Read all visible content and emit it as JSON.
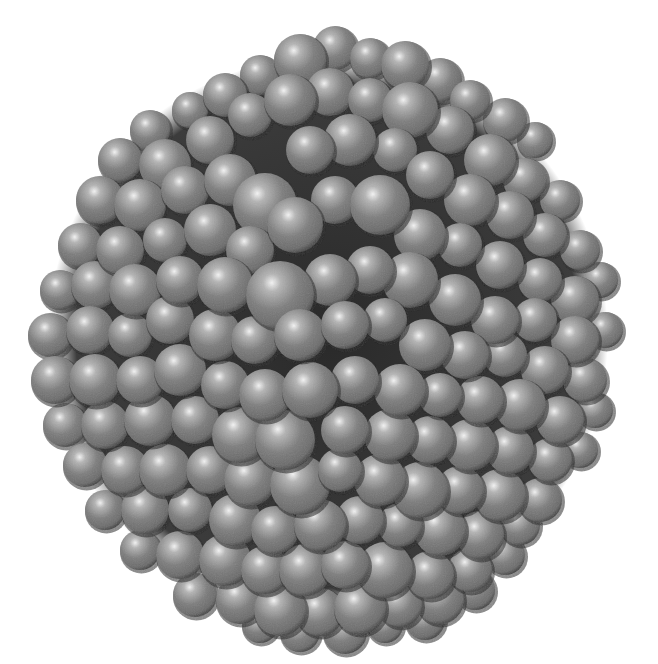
{
  "image": {
    "subject": "spherical cluster of gray spheres (space-filling molecular model)",
    "background": "#ffffff",
    "width": 658,
    "height": 664
  },
  "cluster": {
    "center": [
      328,
      336
    ],
    "radius": 298,
    "colors": {
      "highlight": "#f4f4f4",
      "mid": "#9a9a9a",
      "base": "#7c7c7c",
      "shadow": "#3a3a3a",
      "crevice": "#1e1e1e"
    },
    "spheres": [
      [
        300,
        60,
        26
      ],
      [
        335,
        48,
        22
      ],
      [
        370,
        58,
        20
      ],
      [
        405,
        65,
        24
      ],
      [
        440,
        80,
        22
      ],
      [
        260,
        75,
        20
      ],
      [
        225,
        95,
        22
      ],
      [
        190,
        110,
        18
      ],
      [
        470,
        100,
        20
      ],
      [
        505,
        120,
        22
      ],
      [
        535,
        140,
        18
      ],
      [
        150,
        130,
        20
      ],
      [
        120,
        160,
        22
      ],
      [
        165,
        165,
        26
      ],
      [
        210,
        140,
        24
      ],
      [
        250,
        115,
        22
      ],
      [
        290,
        100,
        26
      ],
      [
        330,
        92,
        24
      ],
      [
        370,
        100,
        22
      ],
      [
        410,
        110,
        28
      ],
      [
        450,
        130,
        24
      ],
      [
        490,
        160,
        26
      ],
      [
        525,
        180,
        22
      ],
      [
        560,
        200,
        20
      ],
      [
        100,
        200,
        24
      ],
      [
        140,
        205,
        26
      ],
      [
        185,
        190,
        24
      ],
      [
        230,
        180,
        26
      ],
      [
        265,
        205,
        32
      ],
      [
        310,
        150,
        24
      ],
      [
        350,
        140,
        26
      ],
      [
        395,
        150,
        22
      ],
      [
        430,
        175,
        24
      ],
      [
        470,
        200,
        26
      ],
      [
        510,
        215,
        24
      ],
      [
        545,
        235,
        22
      ],
      [
        580,
        250,
        20
      ],
      [
        80,
        245,
        22
      ],
      [
        120,
        250,
        24
      ],
      [
        165,
        240,
        22
      ],
      [
        210,
        230,
        26
      ],
      [
        250,
        250,
        24
      ],
      [
        295,
        225,
        28
      ],
      [
        335,
        200,
        24
      ],
      [
        380,
        205,
        30
      ],
      [
        420,
        235,
        26
      ],
      [
        460,
        245,
        22
      ],
      [
        500,
        265,
        24
      ],
      [
        540,
        280,
        22
      ],
      [
        575,
        300,
        24
      ],
      [
        600,
        280,
        18
      ],
      [
        60,
        290,
        20
      ],
      [
        95,
        285,
        24
      ],
      [
        135,
        290,
        26
      ],
      [
        180,
        280,
        24
      ],
      [
        225,
        285,
        28
      ],
      [
        280,
        295,
        34
      ],
      [
        330,
        280,
        26
      ],
      [
        370,
        270,
        24
      ],
      [
        410,
        280,
        28
      ],
      [
        455,
        300,
        26
      ],
      [
        495,
        320,
        24
      ],
      [
        535,
        320,
        22
      ],
      [
        575,
        340,
        24
      ],
      [
        605,
        330,
        18
      ],
      [
        50,
        335,
        22
      ],
      [
        90,
        330,
        24
      ],
      [
        130,
        335,
        22
      ],
      [
        170,
        320,
        24
      ],
      [
        215,
        335,
        26
      ],
      [
        255,
        340,
        24
      ],
      [
        300,
        335,
        26
      ],
      [
        345,
        325,
        24
      ],
      [
        385,
        320,
        22
      ],
      [
        425,
        345,
        26
      ],
      [
        465,
        355,
        24
      ],
      [
        505,
        355,
        22
      ],
      [
        545,
        370,
        24
      ],
      [
        585,
        380,
        22
      ],
      [
        55,
        380,
        24
      ],
      [
        95,
        380,
        26
      ],
      [
        140,
        380,
        24
      ],
      [
        180,
        370,
        26
      ],
      [
        225,
        385,
        24
      ],
      [
        265,
        395,
        26
      ],
      [
        310,
        390,
        28
      ],
      [
        355,
        380,
        24
      ],
      [
        400,
        390,
        26
      ],
      [
        440,
        395,
        22
      ],
      [
        480,
        400,
        24
      ],
      [
        520,
        405,
        26
      ],
      [
        560,
        420,
        24
      ],
      [
        595,
        410,
        18
      ],
      [
        65,
        425,
        22
      ],
      [
        105,
        425,
        24
      ],
      [
        150,
        420,
        26
      ],
      [
        195,
        420,
        24
      ],
      [
        240,
        435,
        28
      ],
      [
        285,
        440,
        30
      ],
      [
        345,
        430,
        24
      ],
      [
        390,
        435,
        26
      ],
      [
        430,
        440,
        24
      ],
      [
        470,
        445,
        26
      ],
      [
        510,
        450,
        24
      ],
      [
        550,
        460,
        22
      ],
      [
        580,
        450,
        18
      ],
      [
        85,
        465,
        22
      ],
      [
        125,
        470,
        24
      ],
      [
        165,
        470,
        26
      ],
      [
        210,
        470,
        24
      ],
      [
        250,
        480,
        26
      ],
      [
        300,
        485,
        30
      ],
      [
        340,
        470,
        22
      ],
      [
        380,
        480,
        26
      ],
      [
        420,
        490,
        28
      ],
      [
        460,
        490,
        24
      ],
      [
        500,
        495,
        26
      ],
      [
        540,
        500,
        22
      ],
      [
        105,
        510,
        20
      ],
      [
        145,
        510,
        24
      ],
      [
        190,
        510,
        22
      ],
      [
        235,
        520,
        26
      ],
      [
        275,
        530,
        24
      ],
      [
        320,
        525,
        26
      ],
      [
        360,
        520,
        24
      ],
      [
        400,
        525,
        22
      ],
      [
        440,
        530,
        26
      ],
      [
        480,
        535,
        24
      ],
      [
        520,
        525,
        20
      ],
      [
        140,
        550,
        20
      ],
      [
        180,
        555,
        24
      ],
      [
        225,
        560,
        26
      ],
      [
        265,
        570,
        24
      ],
      [
        305,
        570,
        26
      ],
      [
        345,
        565,
        24
      ],
      [
        385,
        570,
        28
      ],
      [
        430,
        575,
        24
      ],
      [
        470,
        570,
        22
      ],
      [
        505,
        555,
        20
      ],
      [
        195,
        595,
        22
      ],
      [
        240,
        600,
        24
      ],
      [
        280,
        610,
        26
      ],
      [
        320,
        612,
        24
      ],
      [
        360,
        608,
        26
      ],
      [
        400,
        605,
        22
      ],
      [
        440,
        600,
        24
      ],
      [
        475,
        590,
        20
      ],
      [
        260,
        625,
        18
      ],
      [
        300,
        632,
        20
      ],
      [
        345,
        632,
        22
      ],
      [
        385,
        625,
        18
      ],
      [
        425,
        620,
        20
      ]
    ]
  }
}
